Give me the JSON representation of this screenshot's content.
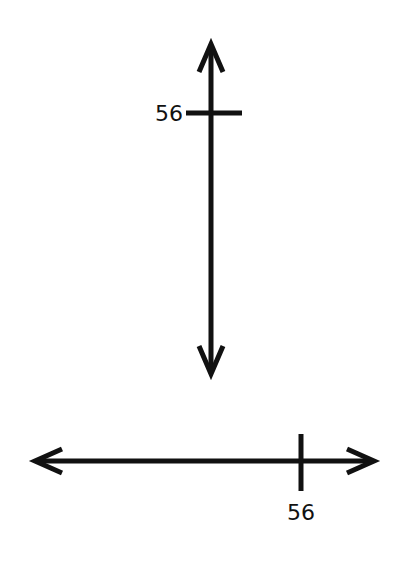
{
  "diagram": {
    "vertical_number_line": {
      "orientation": "vertical",
      "tick_label": "56",
      "arrows": [
        "up",
        "down"
      ]
    },
    "horizontal_number_line": {
      "orientation": "horizontal",
      "tick_label": "56",
      "arrows": [
        "left",
        "right"
      ]
    },
    "colors": {
      "line": "#111111",
      "background": "#ffffff"
    }
  }
}
